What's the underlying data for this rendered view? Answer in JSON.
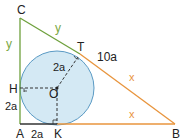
{
  "diagram": {
    "type": "right triangle with inscribed circle",
    "colors": {
      "circle_fill": "#d4e9f4",
      "circle_stroke": "#5a9ac4",
      "green_side": "#6ea03c",
      "orange_side": "#e8943c",
      "dashed": "#333333",
      "text": "#222222"
    },
    "points": {
      "A": {
        "label": "A",
        "x": 20,
        "y": 124
      },
      "B": {
        "label": "B",
        "x": 175,
        "y": 124
      },
      "C": {
        "label": "C",
        "x": 20,
        "y": 18
      },
      "T": {
        "label": "T",
        "x": 80,
        "y": 54
      },
      "H": {
        "label": "H",
        "x": 20,
        "y": 88
      },
      "K": {
        "label": "K",
        "x": 57,
        "y": 124
      },
      "O": {
        "label": "O",
        "x": 57,
        "y": 88
      }
    },
    "circle": {
      "cx": 57,
      "cy": 88,
      "r": 37
    },
    "side_labels": {
      "CH": "y",
      "CT": "y",
      "TB": "x",
      "KB": "x",
      "HA": "2a",
      "AK": "2a",
      "OT": "2a",
      "hypotenuse_marker": "10a"
    }
  }
}
